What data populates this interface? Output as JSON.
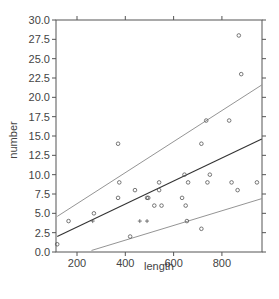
{
  "chart_data": {
    "type": "scatter",
    "title": "",
    "xlabel": "length",
    "ylabel": "number",
    "xlim": [
      113,
      966
    ],
    "ylim": [
      0,
      30
    ],
    "x_ticks": [
      200,
      400,
      600,
      800
    ],
    "x_tick_labels": [
      "200",
      "400",
      "600",
      "800"
    ],
    "y_ticks": [
      0.0,
      2.5,
      5.0,
      7.5,
      10.0,
      12.5,
      15.0,
      17.5,
      20.0,
      22.5,
      25.0,
      27.5,
      30.0
    ],
    "y_tick_labels": [
      "0.0",
      "2.5",
      "5.0",
      "7.5",
      "10.0",
      "12.5",
      "15.0",
      "17.5",
      "20.0",
      "22.5",
      "25.0",
      "27.5",
      "30.0"
    ],
    "grid": false,
    "legend": null,
    "series": [
      {
        "name": "observations",
        "kind": "points",
        "marker": "circle",
        "points": [
          {
            "x": 118,
            "y": 1
          },
          {
            "x": 165,
            "y": 4
          },
          {
            "x": 270,
            "y": 5
          },
          {
            "x": 370,
            "y": 14
          },
          {
            "x": 375,
            "y": 9
          },
          {
            "x": 370,
            "y": 7
          },
          {
            "x": 420,
            "y": 2
          },
          {
            "x": 440,
            "y": 8
          },
          {
            "x": 490,
            "y": 7
          },
          {
            "x": 495,
            "y": 7
          },
          {
            "x": 520,
            "y": 6
          },
          {
            "x": 540,
            "y": 9
          },
          {
            "x": 540,
            "y": 8
          },
          {
            "x": 550,
            "y": 6
          },
          {
            "x": 635,
            "y": 7
          },
          {
            "x": 645,
            "y": 10
          },
          {
            "x": 650,
            "y": 6
          },
          {
            "x": 655,
            "y": 4
          },
          {
            "x": 660,
            "y": 9
          },
          {
            "x": 715,
            "y": 14
          },
          {
            "x": 715,
            "y": 3
          },
          {
            "x": 735,
            "y": 17
          },
          {
            "x": 740,
            "y": 9
          },
          {
            "x": 750,
            "y": 10
          },
          {
            "x": 830,
            "y": 17
          },
          {
            "x": 840,
            "y": 9
          },
          {
            "x": 865,
            "y": 8
          },
          {
            "x": 870,
            "y": 28
          },
          {
            "x": 880,
            "y": 23
          },
          {
            "x": 945,
            "y": 9
          }
        ]
      },
      {
        "name": "observations-plus",
        "kind": "points",
        "marker": "plus",
        "points": [
          {
            "x": 460,
            "y": 4
          },
          {
            "x": 490,
            "y": 4
          },
          {
            "x": 265,
            "y": 4
          }
        ]
      },
      {
        "name": "fitted-line",
        "kind": "line",
        "style": "solid-dark",
        "points": [
          {
            "x": 118,
            "y": 2.0
          },
          {
            "x": 965,
            "y": 14.6
          }
        ]
      },
      {
        "name": "upper-band",
        "kind": "line",
        "style": "solid-light",
        "points": [
          {
            "x": 118,
            "y": 4.6
          },
          {
            "x": 965,
            "y": 21.6
          }
        ]
      },
      {
        "name": "lower-band",
        "kind": "line",
        "style": "solid-light",
        "points": [
          {
            "x": 260,
            "y": 0.2
          },
          {
            "x": 965,
            "y": 6.9
          }
        ]
      }
    ]
  },
  "colors": {
    "axis": "#555555",
    "points": "#555555",
    "fit_line": "#333333",
    "band_line": "#888888"
  }
}
